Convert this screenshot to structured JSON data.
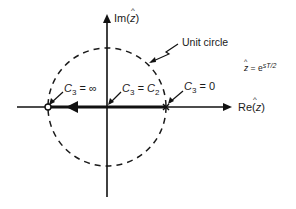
{
  "diagram": {
    "type": "z-plane root locus",
    "axes": {
      "imag_label_prefix": "Im(",
      "imag_label_var": "z",
      "imag_label_suffix": ")",
      "real_label_prefix": "Re(",
      "real_label_var": "z",
      "real_label_suffix": ")"
    },
    "circle_label": "Unit circle",
    "equation": {
      "lhs": "z",
      "eq": " = e",
      "exponent": "sT/2"
    },
    "points": [
      {
        "label_c": "C",
        "sub": "3",
        "rhs": " = ∞",
        "marker": "open-circle",
        "position": "left unit-circle crossing"
      },
      {
        "label_c": "C",
        "sub": "3",
        "rhs_c": " = C",
        "rhs_sub": "2",
        "marker": "none",
        "position": "origin"
      },
      {
        "label_c": "C",
        "sub": "3",
        "rhs": " = 0",
        "marker": "cross",
        "position": "right unit-circle crossing"
      }
    ],
    "hat_symbol": "^"
  }
}
